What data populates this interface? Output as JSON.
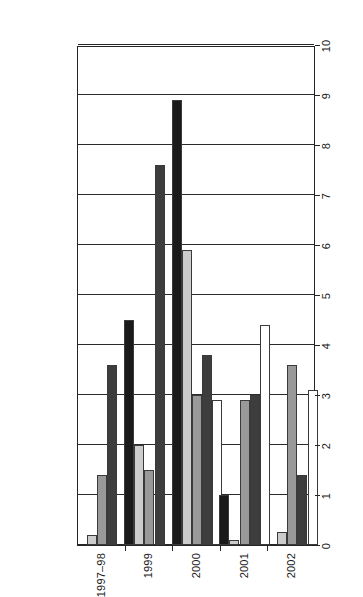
{
  "chart_data": {
    "type": "bar",
    "orientation": "horizontal-rotated",
    "title": "",
    "subtitle": "",
    "xlabel": "",
    "ylabel": "",
    "categories": [
      "1997–98",
      "1999",
      "2000",
      "2001",
      "2002"
    ],
    "series": [
      {
        "name": "Pooled Sales",
        "color": "#1a1a1a",
        "values": [
          0.0,
          4.5,
          8.9,
          1.0,
          0.0
        ]
      },
      {
        "name": "Auctions",
        "color": "#cccccc",
        "values": [
          0.2,
          2.0,
          5.9,
          0.1,
          0.25
        ]
      },
      {
        "name": "Collections",
        "color": "#999999",
        "values": [
          1.4,
          1.5,
          3.0,
          2.9,
          3.6
        ]
      },
      {
        "name": "Recourse",
        "color": "#3d3d3d",
        "values": [
          3.6,
          7.6,
          3.8,
          3.0,
          1.4
        ]
      },
      {
        "name": "Other",
        "color": "#ffffff",
        "values": [
          0.0,
          0.0,
          2.9,
          4.4,
          3.1
        ]
      }
    ],
    "value_axis": {
      "ticks": [
        0,
        1,
        2,
        3,
        4,
        5,
        6,
        7,
        8,
        9,
        10
      ],
      "tick_labels": [
        "0",
        "1",
        "2",
        "3",
        "4",
        "5",
        "6",
        "7",
        "8",
        "9",
        "10"
      ],
      "min": 0,
      "max": 10,
      "direction": "descending-left-to-right"
    },
    "grid": true,
    "legend_position": "right",
    "legend_entries": [
      "Pooled Sales",
      "Auctions",
      "Collections",
      "Recourse",
      "Other"
    ]
  }
}
